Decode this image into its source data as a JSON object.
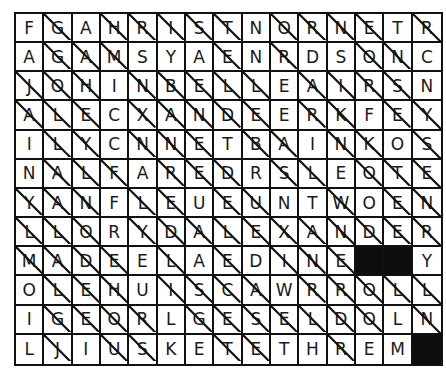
{
  "puzzle": {
    "type": "word-search",
    "columns": 15,
    "rows_count": 12,
    "colors": {
      "line": "#111111",
      "blocked": "#0d0d0d",
      "background": "#ffffff"
    },
    "rows": [
      {
        "letters": [
          "F",
          "G",
          "A",
          "H",
          "R",
          "I",
          "S",
          "T",
          "N",
          "O",
          "R",
          "N",
          "E",
          "T",
          "R"
        ],
        "struck": [
          0,
          1,
          0,
          1,
          1,
          1,
          1,
          1,
          0,
          1,
          1,
          1,
          1,
          0,
          1
        ]
      },
      {
        "letters": [
          "A",
          "G",
          "A",
          "M",
          "S",
          "Y",
          "A",
          "E",
          "N",
          "R",
          "D",
          "S",
          "O",
          "N",
          "C"
        ],
        "struck": [
          0,
          1,
          1,
          1,
          0,
          0,
          0,
          1,
          0,
          1,
          0,
          0,
          1,
          1,
          0
        ]
      },
      {
        "letters": [
          "J",
          "O",
          "H",
          "I",
          "N",
          "B",
          "E",
          "L",
          "L",
          "E",
          "A",
          "I",
          "R",
          "S",
          "N"
        ],
        "struck": [
          1,
          1,
          1,
          0,
          1,
          1,
          1,
          1,
          1,
          0,
          1,
          1,
          1,
          1,
          0
        ]
      },
      {
        "letters": [
          "A",
          "L",
          "E",
          "C",
          "X",
          "A",
          "N",
          "D",
          "E",
          "E",
          "R",
          "K",
          "F",
          "E",
          "Y"
        ],
        "struck": [
          1,
          1,
          1,
          0,
          1,
          1,
          1,
          1,
          1,
          0,
          1,
          1,
          0,
          1,
          1
        ]
      },
      {
        "letters": [
          "I",
          "L",
          "Y",
          "C",
          "N",
          "N",
          "E",
          "T",
          "B",
          "A",
          "I",
          "N",
          "K",
          "O",
          "S"
        ],
        "struck": [
          0,
          1,
          1,
          0,
          1,
          1,
          1,
          0,
          1,
          1,
          0,
          1,
          1,
          0,
          1
        ]
      },
      {
        "letters": [
          "N",
          "A",
          "L",
          "F",
          "A",
          "R",
          "E",
          "D",
          "R",
          "S",
          "L",
          "E",
          "O",
          "T",
          "E"
        ],
        "struck": [
          0,
          1,
          1,
          1,
          0,
          1,
          1,
          1,
          0,
          1,
          1,
          0,
          1,
          1,
          1
        ]
      },
      {
        "letters": [
          "Y",
          "A",
          "N",
          "F",
          "L",
          "E",
          "U",
          "E",
          "U",
          "N",
          "T",
          "W",
          "O",
          "E",
          "N"
        ],
        "struck": [
          1,
          1,
          1,
          0,
          1,
          1,
          0,
          1,
          1,
          0,
          0,
          1,
          0,
          1,
          1
        ]
      },
      {
        "letters": [
          "L",
          "L",
          "O",
          "R",
          "Y",
          "D",
          "A",
          "L",
          "E",
          "X",
          "A",
          "N",
          "D",
          "E",
          "R"
        ],
        "struck": [
          1,
          1,
          1,
          0,
          1,
          1,
          1,
          1,
          1,
          1,
          1,
          1,
          1,
          1,
          1
        ]
      },
      {
        "letters": [
          "M",
          "A",
          "D",
          "E",
          "E",
          "L",
          "A",
          "E",
          "D",
          "I",
          "N",
          "E",
          "#",
          "#",
          "Y"
        ],
        "struck": [
          1,
          1,
          1,
          1,
          0,
          1,
          0,
          1,
          0,
          1,
          1,
          1,
          0,
          0,
          0
        ]
      },
      {
        "letters": [
          "O",
          "L",
          "E",
          "H",
          "U",
          "I",
          "S",
          "C",
          "A",
          "W",
          "R",
          "R",
          "O",
          "L",
          "L"
        ],
        "struck": [
          0,
          1,
          1,
          1,
          0,
          1,
          1,
          1,
          1,
          0,
          1,
          1,
          1,
          1,
          1
        ]
      },
      {
        "letters": [
          "I",
          "G",
          "E",
          "O",
          "R",
          "L",
          "G",
          "E",
          "S",
          "E",
          "L",
          "D",
          "O",
          "L",
          "N"
        ],
        "struck": [
          0,
          1,
          1,
          1,
          1,
          0,
          1,
          1,
          1,
          1,
          1,
          1,
          1,
          0,
          1
        ]
      },
      {
        "letters": [
          "L",
          "J",
          "I",
          "U",
          "S",
          "K",
          "E",
          "T",
          "E",
          "T",
          "H",
          "R",
          "E",
          "M",
          "#"
        ],
        "struck": [
          0,
          1,
          0,
          1,
          1,
          0,
          0,
          1,
          1,
          0,
          0,
          1,
          0,
          0,
          0
        ]
      }
    ]
  }
}
